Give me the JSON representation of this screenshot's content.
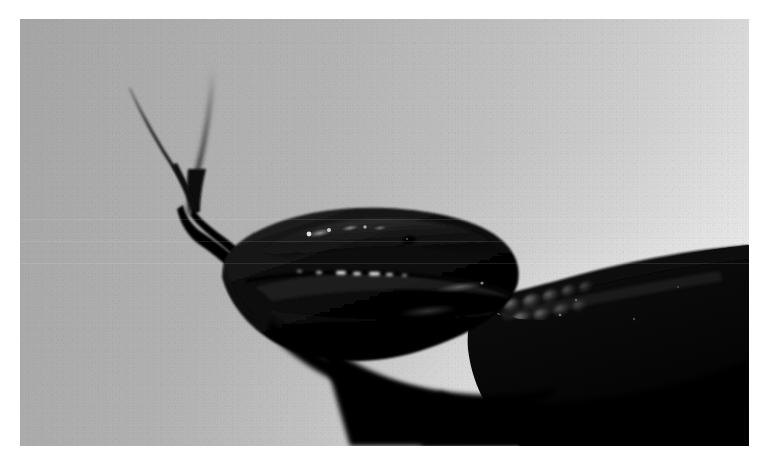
{
  "image": {
    "title": "Black snake head with forked tongue extended",
    "subject": "snake",
    "medium": "photograph",
    "orientation": "landscape",
    "width_px": 768,
    "height_px": 465,
    "plate": {
      "left": 20,
      "top": 19,
      "width": 729,
      "height": 427
    }
  },
  "palette": {
    "page_margin": "#ffffff",
    "background_left": "#a9a9a9",
    "background_mid": "#c4c4c4",
    "background_right": "#ededed",
    "snake_black": "#050505",
    "snake_body": "#0a0a0a",
    "scale_highlight": "#6a6a6a",
    "specular_white": "#f2f2f2",
    "tongue_black": "#0b0b0b",
    "tongue_blur_gray": "#6f6f6f"
  },
  "subject": {
    "name": "snake",
    "parts": [
      {
        "key": "tongue",
        "label": "Forked tongue",
        "description": "Two slender tines raised above the snout, left tine sharp, right tine motion blurred"
      },
      {
        "key": "tongue_tine_left",
        "label": "Left tongue tine",
        "tip": [
          130,
          88
        ]
      },
      {
        "key": "tongue_tine_right",
        "label": "Right tongue tine",
        "tip": [
          212,
          68
        ]
      },
      {
        "key": "tongue_fork",
        "label": "Tongue fork junction",
        "point": [
          192,
          210
        ]
      },
      {
        "key": "snout",
        "label": "Snout",
        "point": [
          231,
          258
        ]
      },
      {
        "key": "head",
        "label": "Head",
        "description": "Glossy dark head with specular highlights along the upper labials"
      },
      {
        "key": "eye",
        "label": "Eye",
        "point": [
          409,
          240
        ]
      },
      {
        "key": "jaw",
        "label": "Lower jaw",
        "description": "Smooth curving underside sweeping down to the right"
      },
      {
        "key": "neck_scales",
        "label": "Neck scales",
        "description": "Cluster of individually lit keeled scales behind the jaw"
      },
      {
        "key": "body",
        "label": "Body",
        "description": "Thick black coil exiting the frame at the right edge"
      }
    ]
  }
}
